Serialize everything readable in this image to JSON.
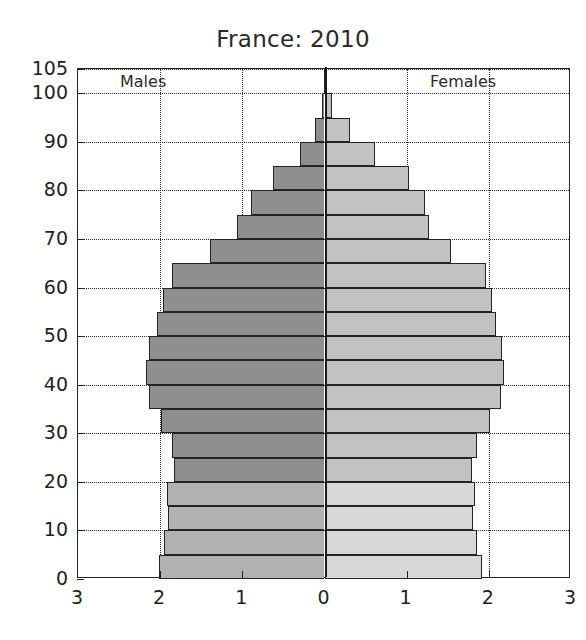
{
  "chart_data": {
    "type": "bar",
    "subtype": "population-pyramid",
    "title": "France: 2010",
    "xlabel": "",
    "ylabel": "",
    "unit": "millions",
    "xlim": [
      -3,
      3
    ],
    "ylim": [
      0,
      105
    ],
    "grid": true,
    "legend_position": "inside-top",
    "left_series_label": "Males",
    "right_series_label": "Females",
    "xtick_labels": [
      "3",
      "2",
      "1",
      "0",
      "1",
      "2",
      "3"
    ],
    "xtick_values": [
      -3,
      -2,
      -1,
      0,
      1,
      2,
      3
    ],
    "ytick_labels": [
      "0",
      "10",
      "20",
      "30",
      "40",
      "50",
      "60",
      "70",
      "80",
      "90",
      "100",
      "105"
    ],
    "ytick_values": [
      0,
      10,
      20,
      30,
      40,
      50,
      60,
      70,
      80,
      90,
      100,
      105
    ],
    "age_groups": [
      "0-4",
      "5-9",
      "10-14",
      "15-19",
      "20-24",
      "25-29",
      "30-34",
      "35-39",
      "40-44",
      "45-49",
      "50-54",
      "55-59",
      "60-64",
      "65-69",
      "70-74",
      "75-79",
      "80-84",
      "85-89",
      "90-94",
      "95-99",
      "100-104"
    ],
    "series": [
      {
        "name": "Males",
        "color": "#8f8f8f",
        "color_young": "#b2b2b2",
        "values": [
          2.01,
          1.95,
          1.9,
          1.92,
          1.83,
          1.85,
          1.99,
          2.13,
          2.17,
          2.13,
          2.04,
          1.96,
          1.85,
          1.39,
          1.07,
          0.9,
          0.63,
          0.3,
          0.12,
          0.03,
          0.004
        ]
      },
      {
        "name": "Females",
        "color": "#c2c2c2",
        "color_young": "#d8d8d8",
        "values": [
          1.92,
          1.86,
          1.81,
          1.83,
          1.79,
          1.85,
          2.01,
          2.15,
          2.19,
          2.16,
          2.09,
          2.04,
          1.97,
          1.54,
          1.27,
          1.22,
          1.03,
          0.61,
          0.31,
          0.09,
          0.015
        ]
      }
    ],
    "young_threshold_age": 20
  },
  "axis": {
    "left_label_males": "Males",
    "right_label_females": "Females"
  },
  "colors": {
    "male_old": "#8f8f8f",
    "male_young": "#b2b2b2",
    "female_old": "#c2c2c2",
    "female_young": "#d8d8d8",
    "frame": "#222222",
    "grid": "#2b2b2b",
    "text": "#1f1f1f"
  }
}
